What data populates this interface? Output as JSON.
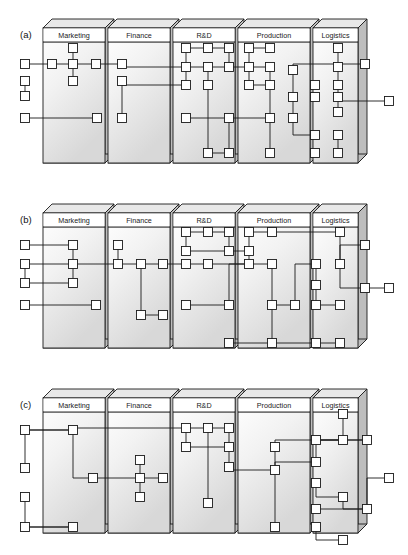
{
  "figure": {
    "type": "diagram",
    "panel_count": 3,
    "compartment_labels": [
      "Marketing",
      "Finance",
      "R&D",
      "Production",
      "Logistics"
    ],
    "colors": {
      "stroke": "#1a1a1a",
      "node_fill": "#ffffff",
      "slab_face_top": "#ffffff",
      "slab_face_bottom": "#d8d8d8",
      "slab_side": "#bdbdbd",
      "slab_top_edge": "#e8e8e8",
      "background": "#ffffff"
    },
    "node_size": 9,
    "line_width": 0.9
  },
  "panels": [
    {
      "caption": "(a)",
      "caption_x": 20,
      "caption_y": 38,
      "compartments": [
        {
          "label": "Marketing",
          "x": 43,
          "w": 62
        },
        {
          "label": "Finance",
          "x": 108,
          "w": 62
        },
        {
          "label": "R&D",
          "x": 173,
          "w": 62
        },
        {
          "label": "Production",
          "x": 238,
          "w": 72
        },
        {
          "label": "Logistics",
          "x": 313,
          "w": 45
        }
      ],
      "nodes": [
        {
          "id": "a1",
          "x": 25,
          "y": 64
        },
        {
          "id": "a2",
          "x": 25,
          "y": 81
        },
        {
          "id": "a3",
          "x": 25,
          "y": 96
        },
        {
          "id": "a4",
          "x": 25,
          "y": 118
        },
        {
          "id": "a5",
          "x": 52,
          "y": 64
        },
        {
          "id": "a6",
          "x": 73,
          "y": 48
        },
        {
          "id": "a7",
          "x": 73,
          "y": 64
        },
        {
          "id": "a8",
          "x": 73,
          "y": 81
        },
        {
          "id": "a9",
          "x": 96,
          "y": 64
        },
        {
          "id": "a10",
          "x": 122,
          "y": 64
        },
        {
          "id": "a11",
          "x": 122,
          "y": 81
        },
        {
          "id": "a12",
          "x": 122,
          "y": 118
        },
        {
          "id": "a13",
          "x": 97,
          "y": 118
        },
        {
          "id": "a14",
          "x": 186,
          "y": 48
        },
        {
          "id": "a15",
          "x": 208,
          "y": 48
        },
        {
          "id": "a16",
          "x": 229,
          "y": 48
        },
        {
          "id": "a17",
          "x": 186,
          "y": 67
        },
        {
          "id": "a18",
          "x": 208,
          "y": 67
        },
        {
          "id": "a19",
          "x": 229,
          "y": 67
        },
        {
          "id": "a20",
          "x": 186,
          "y": 85
        },
        {
          "id": "a21",
          "x": 208,
          "y": 85
        },
        {
          "id": "a22",
          "x": 186,
          "y": 118
        },
        {
          "id": "a23",
          "x": 229,
          "y": 118
        },
        {
          "id": "a24",
          "x": 208,
          "y": 153
        },
        {
          "id": "a25",
          "x": 229,
          "y": 153
        },
        {
          "id": "a26",
          "x": 249,
          "y": 48
        },
        {
          "id": "a27",
          "x": 270,
          "y": 48
        },
        {
          "id": "a28",
          "x": 249,
          "y": 67
        },
        {
          "id": "a29",
          "x": 270,
          "y": 67
        },
        {
          "id": "a30",
          "x": 249,
          "y": 85
        },
        {
          "id": "a31",
          "x": 270,
          "y": 85
        },
        {
          "id": "a32",
          "x": 293,
          "y": 70
        },
        {
          "id": "a33",
          "x": 293,
          "y": 97
        },
        {
          "id": "a34",
          "x": 293,
          "y": 118
        },
        {
          "id": "a35",
          "x": 270,
          "y": 118
        },
        {
          "id": "a36",
          "x": 270,
          "y": 153
        },
        {
          "id": "a37",
          "x": 315,
          "y": 97
        },
        {
          "id": "a38",
          "x": 315,
          "y": 85
        },
        {
          "id": "a39",
          "x": 315,
          "y": 135
        },
        {
          "id": "a40",
          "x": 315,
          "y": 153
        },
        {
          "id": "a41",
          "x": 338,
          "y": 48
        },
        {
          "id": "a42",
          "x": 338,
          "y": 67
        },
        {
          "id": "a43",
          "x": 338,
          "y": 85
        },
        {
          "id": "a44",
          "x": 338,
          "y": 97
        },
        {
          "id": "a45",
          "x": 338,
          "y": 112
        },
        {
          "id": "a46",
          "x": 338,
          "y": 135
        },
        {
          "id": "a47",
          "x": 338,
          "y": 153
        },
        {
          "id": "a48",
          "x": 365,
          "y": 64
        },
        {
          "id": "a49",
          "x": 389,
          "y": 101
        }
      ],
      "edges": [
        [
          "a1",
          "a5"
        ],
        [
          "a5",
          "a7"
        ],
        [
          "a7",
          "a6"
        ],
        [
          "a7",
          "a9"
        ],
        [
          "a7",
          "a8"
        ],
        [
          "a9",
          "a10"
        ],
        [
          "a2",
          "a3"
        ],
        [
          "a2h",
          "a11"
        ],
        [
          "a10",
          "a17"
        ],
        [
          "a11",
          "a20"
        ],
        [
          "a11",
          "a12"
        ],
        [
          "a4",
          "a13"
        ],
        [
          "a13d",
          "a36"
        ],
        [
          "a12d",
          "a24"
        ],
        [
          "a14",
          "a15"
        ],
        [
          "a15",
          "a16"
        ],
        [
          "a14",
          "a17"
        ],
        [
          "a16",
          "a19"
        ],
        [
          "a17",
          "a18"
        ],
        [
          "a18",
          "a19"
        ],
        [
          "a17",
          "a20"
        ],
        [
          "a18",
          "a21"
        ],
        [
          "a19",
          "a28"
        ],
        [
          "a21",
          "a24"
        ],
        [
          "a22",
          "a23"
        ],
        [
          "a23",
          "a25"
        ],
        [
          "a24",
          "a25"
        ],
        [
          "a23",
          "a35"
        ],
        [
          "a26",
          "a27"
        ],
        [
          "a26",
          "a28"
        ],
        [
          "a28",
          "a29"
        ],
        [
          "a28",
          "a30"
        ],
        [
          "a29",
          "a31"
        ],
        [
          "a30",
          "a31"
        ],
        [
          "a31",
          "a35"
        ],
        [
          "a35",
          "a36"
        ],
        [
          "a32",
          "a33"
        ],
        [
          "a33",
          "a34"
        ],
        [
          "a34",
          "a39"
        ],
        [
          "a32",
          "a48"
        ],
        [
          "a41",
          "a42"
        ],
        [
          "a42",
          "a43"
        ],
        [
          "a43",
          "a44"
        ],
        [
          "a44",
          "a45"
        ],
        [
          "a46",
          "a47"
        ],
        [
          "a44",
          "a49"
        ]
      ]
    },
    {
      "caption": "(b)",
      "caption_x": 20,
      "caption_y": 223,
      "compartments": [
        {
          "label": "Marketing",
          "x": 43,
          "w": 62
        },
        {
          "label": "Finance",
          "x": 108,
          "w": 62
        },
        {
          "label": "R&D",
          "x": 173,
          "w": 62
        },
        {
          "label": "Production",
          "x": 238,
          "w": 72
        },
        {
          "label": "Logistics",
          "x": 313,
          "w": 45
        }
      ],
      "nodes": [
        {
          "id": "b1",
          "x": 25,
          "y": 245
        },
        {
          "id": "b2",
          "x": 25,
          "y": 264
        },
        {
          "id": "b3",
          "x": 25,
          "y": 283
        },
        {
          "id": "b4",
          "x": 25,
          "y": 305
        },
        {
          "id": "b5",
          "x": 73,
          "y": 245
        },
        {
          "id": "b6",
          "x": 73,
          "y": 264
        },
        {
          "id": "b7",
          "x": 73,
          "y": 283
        },
        {
          "id": "b8",
          "x": 96,
          "y": 305
        },
        {
          "id": "b9",
          "x": 118,
          "y": 245
        },
        {
          "id": "b10",
          "x": 118,
          "y": 264
        },
        {
          "id": "b11",
          "x": 141,
          "y": 264
        },
        {
          "id": "b12",
          "x": 163,
          "y": 264
        },
        {
          "id": "b13",
          "x": 141,
          "y": 315
        },
        {
          "id": "b14",
          "x": 163,
          "y": 315
        },
        {
          "id": "b15",
          "x": 186,
          "y": 232
        },
        {
          "id": "b16",
          "x": 208,
          "y": 232
        },
        {
          "id": "b17",
          "x": 229,
          "y": 232
        },
        {
          "id": "b18",
          "x": 186,
          "y": 251
        },
        {
          "id": "b19",
          "x": 229,
          "y": 251
        },
        {
          "id": "b20",
          "x": 186,
          "y": 264
        },
        {
          "id": "b21",
          "x": 208,
          "y": 264
        },
        {
          "id": "b22",
          "x": 186,
          "y": 305
        },
        {
          "id": "b23",
          "x": 229,
          "y": 305
        },
        {
          "id": "b24",
          "x": 229,
          "y": 343
        },
        {
          "id": "b25",
          "x": 249,
          "y": 232
        },
        {
          "id": "b26",
          "x": 272,
          "y": 232
        },
        {
          "id": "b27",
          "x": 249,
          "y": 251
        },
        {
          "id": "b28",
          "x": 249,
          "y": 264
        },
        {
          "id": "b29",
          "x": 272,
          "y": 264
        },
        {
          "id": "b30",
          "x": 272,
          "y": 305
        },
        {
          "id": "b31",
          "x": 295,
          "y": 305
        },
        {
          "id": "b32",
          "x": 272,
          "y": 343
        },
        {
          "id": "b33",
          "x": 316,
          "y": 264
        },
        {
          "id": "b34",
          "x": 316,
          "y": 285
        },
        {
          "id": "b35",
          "x": 316,
          "y": 305
        },
        {
          "id": "b36",
          "x": 316,
          "y": 343
        },
        {
          "id": "b37",
          "x": 340,
          "y": 232
        },
        {
          "id": "b38",
          "x": 340,
          "y": 264
        },
        {
          "id": "b39",
          "x": 340,
          "y": 305
        },
        {
          "id": "b40",
          "x": 340,
          "y": 343
        },
        {
          "id": "b41",
          "x": 365,
          "y": 245
        },
        {
          "id": "b42",
          "x": 365,
          "y": 288
        },
        {
          "id": "b43",
          "x": 389,
          "y": 288
        }
      ],
      "edges": [
        [
          "b1",
          "b5"
        ],
        [
          "b5",
          "b6"
        ],
        [
          "b6",
          "b7"
        ],
        [
          "b2",
          "b6"
        ],
        [
          "b2",
          "b3"
        ],
        [
          "b3",
          "b7"
        ],
        [
          "b4",
          "b8"
        ],
        [
          "b6",
          "b10"
        ],
        [
          "b9",
          "b10"
        ],
        [
          "b10",
          "b11"
        ],
        [
          "b11",
          "b12"
        ],
        [
          "b11",
          "b13"
        ],
        [
          "b13",
          "b14"
        ],
        [
          "b12",
          "b20"
        ],
        [
          "b15",
          "b16"
        ],
        [
          "b16",
          "b17"
        ],
        [
          "b15",
          "b18"
        ],
        [
          "b17",
          "b19"
        ],
        [
          "b18",
          "b19"
        ],
        [
          "b20",
          "b21"
        ],
        [
          "b21",
          "b28"
        ],
        [
          "b22",
          "b23"
        ],
        [
          "b23",
          "b28"
        ],
        [
          "b25",
          "b26"
        ],
        [
          "b25",
          "b27"
        ],
        [
          "b27",
          "b28"
        ],
        [
          "b28",
          "b29"
        ],
        [
          "b29",
          "b30"
        ],
        [
          "b30",
          "b31"
        ],
        [
          "b30",
          "b32"
        ],
        [
          "b32",
          "b36"
        ],
        [
          "b31",
          "b33"
        ],
        [
          "b33",
          "b34"
        ],
        [
          "b34",
          "b35"
        ],
        [
          "b35",
          "b39"
        ],
        [
          "b36",
          "b40"
        ],
        [
          "b37",
          "b38"
        ],
        [
          "b38",
          "b41"
        ],
        [
          "b38",
          "b42"
        ],
        [
          "b42",
          "b43"
        ],
        [
          "b24",
          "b32"
        ],
        [
          "b19",
          "b27"
        ],
        [
          "b26",
          "b37"
        ]
      ]
    },
    {
      "caption": "(c)",
      "caption_x": 20,
      "caption_y": 408,
      "compartments": [
        {
          "label": "Marketing",
          "x": 43,
          "w": 62
        },
        {
          "label": "Finance",
          "x": 108,
          "w": 62
        },
        {
          "label": "R&D",
          "x": 173,
          "w": 62
        },
        {
          "label": "Production",
          "x": 238,
          "w": 72
        },
        {
          "label": "Logistics",
          "x": 313,
          "w": 45
        }
      ],
      "nodes": [
        {
          "id": "c1",
          "x": 25,
          "y": 430
        },
        {
          "id": "c2",
          "x": 25,
          "y": 468
        },
        {
          "id": "c3",
          "x": 25,
          "y": 497
        },
        {
          "id": "c4",
          "x": 25,
          "y": 527
        },
        {
          "id": "c5",
          "x": 73,
          "y": 430
        },
        {
          "id": "c6",
          "x": 93,
          "y": 478
        },
        {
          "id": "c7",
          "x": 73,
          "y": 527
        },
        {
          "id": "c8",
          "x": 140,
          "y": 460
        },
        {
          "id": "c9",
          "x": 140,
          "y": 478
        },
        {
          "id": "c10",
          "x": 140,
          "y": 497
        },
        {
          "id": "c11",
          "x": 163,
          "y": 478
        },
        {
          "id": "c12",
          "x": 186,
          "y": 428
        },
        {
          "id": "c13",
          "x": 208,
          "y": 428
        },
        {
          "id": "c14",
          "x": 229,
          "y": 428
        },
        {
          "id": "c15",
          "x": 186,
          "y": 447
        },
        {
          "id": "c16",
          "x": 229,
          "y": 447
        },
        {
          "id": "c17",
          "x": 229,
          "y": 467
        },
        {
          "id": "c18",
          "x": 208,
          "y": 503
        },
        {
          "id": "c19",
          "x": 275,
          "y": 447
        },
        {
          "id": "c20",
          "x": 275,
          "y": 470
        },
        {
          "id": "c21",
          "x": 275,
          "y": 527
        },
        {
          "id": "c22",
          "x": 316,
          "y": 440
        },
        {
          "id": "c23",
          "x": 316,
          "y": 462
        },
        {
          "id": "c24",
          "x": 316,
          "y": 483
        },
        {
          "id": "c25",
          "x": 316,
          "y": 509
        },
        {
          "id": "c26",
          "x": 316,
          "y": 527
        },
        {
          "id": "c27",
          "x": 343,
          "y": 414
        },
        {
          "id": "c28",
          "x": 343,
          "y": 440
        },
        {
          "id": "c29",
          "x": 343,
          "y": 497
        },
        {
          "id": "c30",
          "x": 343,
          "y": 540
        },
        {
          "id": "c31",
          "x": 367,
          "y": 440
        },
        {
          "id": "c32",
          "x": 367,
          "y": 509
        },
        {
          "id": "c33",
          "x": 389,
          "y": 478
        }
      ],
      "edges": [
        [
          "c1",
          "c5"
        ],
        [
          "c5",
          "c12"
        ],
        [
          "c2",
          "c5"
        ],
        [
          "c3",
          "c7"
        ],
        [
          "c4",
          "c7"
        ],
        [
          "c5",
          "c6"
        ],
        [
          "c6",
          "c9"
        ],
        [
          "c8",
          "c9"
        ],
        [
          "c9",
          "c10"
        ],
        [
          "c9",
          "c11"
        ],
        [
          "c12",
          "c13"
        ],
        [
          "c13",
          "c14"
        ],
        [
          "c12",
          "c15"
        ],
        [
          "c14",
          "c16"
        ],
        [
          "c15",
          "c16"
        ],
        [
          "c16",
          "c17"
        ],
        [
          "c13",
          "c18"
        ],
        [
          "c17",
          "c20"
        ],
        [
          "c19",
          "c20"
        ],
        [
          "c19",
          "c22"
        ],
        [
          "c20",
          "c21"
        ],
        [
          "c20",
          "c23"
        ],
        [
          "c22",
          "c28"
        ],
        [
          "c23",
          "c31"
        ],
        [
          "c24",
          "c29"
        ],
        [
          "c25",
          "c32"
        ],
        [
          "c27",
          "c22"
        ],
        [
          "c28",
          "c31"
        ],
        [
          "c29",
          "c32"
        ],
        [
          "c32",
          "c33"
        ],
        [
          "c26",
          "c30"
        ]
      ]
    }
  ]
}
